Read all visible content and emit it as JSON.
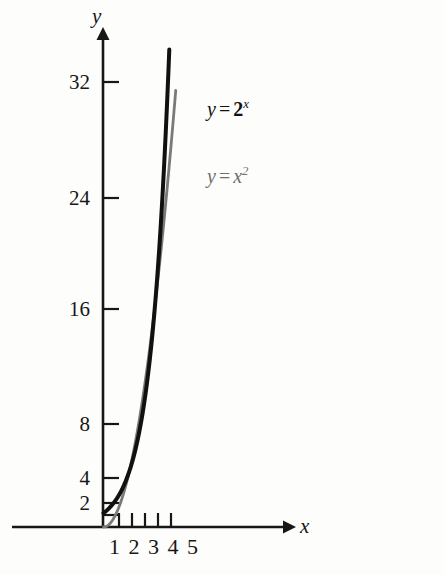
{
  "figure": {
    "background_color": "#fdfdfc",
    "axis_color": "#171717",
    "curve_exp_color": "#111111",
    "curve_sq_color": "#7a7a7a"
  },
  "axes": {
    "x_axis_name": "x",
    "y_axis_name": "y"
  },
  "labels": {
    "exp": {
      "y": "y",
      "equals": "=",
      "base": "2",
      "exponent": "x"
    },
    "sq": {
      "y": "y",
      "equals": "=",
      "base": "x",
      "exponent": "2"
    }
  },
  "xticks_row": "1 2 3 4 5",
  "chart_data": {
    "type": "line",
    "title": "",
    "xlabel": "x",
    "ylabel": "y",
    "xlim": [
      0,
      6.6
    ],
    "ylim": [
      0,
      36
    ],
    "grid": false,
    "legend": "inline-annotations",
    "xticks": [
      1,
      2,
      3,
      4,
      5
    ],
    "xtick_labels": [
      "1",
      "2",
      "3",
      "4",
      "5"
    ],
    "yticks": [
      2,
      4,
      8,
      16,
      24,
      32
    ],
    "ytick_labels": [
      "2",
      "4",
      "8",
      "16",
      "24",
      "32"
    ],
    "series": [
      {
        "name": "y = 2^x",
        "label": "y = 2x",
        "color": "#111111",
        "style": "solid-thick",
        "x": [
          0,
          0.5,
          1,
          1.5,
          2,
          2.5,
          3,
          3.5,
          4,
          4.5,
          5,
          5.1
        ],
        "values": [
          1,
          1.41,
          2,
          2.83,
          4,
          5.66,
          8,
          11.31,
          16,
          22.63,
          32,
          34.3
        ]
      },
      {
        "name": "y = x^2",
        "label": "y = x2",
        "color": "#7a7a7a",
        "style": "solid-thin",
        "x": [
          0,
          0.5,
          1,
          1.5,
          2,
          2.5,
          3,
          3.5,
          4,
          4.5,
          5,
          5.6
        ],
        "values": [
          0,
          0.25,
          1,
          2.25,
          4,
          6.25,
          9,
          12.25,
          16,
          20.25,
          25,
          31.4
        ]
      }
    ],
    "annotations": [
      {
        "text": "y = 2x",
        "target_series": "y = 2^x",
        "x_px": 207,
        "y_px": 109
      },
      {
        "text": "y = x2",
        "target_series": "y = x^2",
        "x_px": 207,
        "y_px": 176
      }
    ]
  }
}
